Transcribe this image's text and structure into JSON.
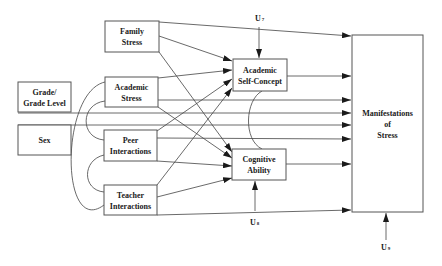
{
  "diagram": {
    "type": "path-model",
    "colors": {
      "line": "#444444",
      "box_border": "#555555",
      "text": "#1a1a1a",
      "background": "#ffffff"
    },
    "nodes": [
      {
        "id": "grade",
        "lines": [
          "Grade/",
          "Grade Level"
        ]
      },
      {
        "id": "sex",
        "lines": [
          "Sex"
        ]
      },
      {
        "id": "family",
        "lines": [
          "Family",
          "Stress"
        ]
      },
      {
        "id": "academic",
        "lines": [
          "Academic",
          "Stress"
        ]
      },
      {
        "id": "peer",
        "lines": [
          "Peer",
          "Interactions"
        ]
      },
      {
        "id": "teacher",
        "lines": [
          "Teacher",
          "Interactions"
        ]
      },
      {
        "id": "selfconcept",
        "lines": [
          "Academic",
          "Self-Concept"
        ]
      },
      {
        "id": "cognitive",
        "lines": [
          "Cognitive",
          "Ability"
        ]
      },
      {
        "id": "manifest",
        "lines": [
          "Manifestations",
          "of",
          "Stress"
        ]
      }
    ],
    "errors": [
      {
        "id": "u7",
        "label": "U",
        "sub": "7",
        "target": "selfconcept"
      },
      {
        "id": "u8",
        "label": "U",
        "sub": "8",
        "target": "cognitive"
      },
      {
        "id": "u9",
        "label": "U",
        "sub": "9",
        "target": "manifest"
      }
    ],
    "edges": [
      {
        "from": "family",
        "to": "manifest"
      },
      {
        "from": "family",
        "to": "selfconcept"
      },
      {
        "from": "family",
        "to": "cognitive"
      },
      {
        "from": "academic",
        "to": "selfconcept"
      },
      {
        "from": "academic",
        "to": "manifest"
      },
      {
        "from": "academic",
        "to": "cognitive"
      },
      {
        "from": "peer",
        "to": "selfconcept"
      },
      {
        "from": "peer",
        "to": "manifest"
      },
      {
        "from": "peer",
        "to": "cognitive"
      },
      {
        "from": "teacher",
        "to": "selfconcept"
      },
      {
        "from": "teacher",
        "to": "cognitive"
      },
      {
        "from": "teacher",
        "to": "manifest"
      },
      {
        "from": "grade",
        "to": "manifest"
      },
      {
        "from": "sex",
        "to": "manifest"
      },
      {
        "from": "selfconcept",
        "to": "manifest"
      },
      {
        "from": "cognitive",
        "to": "manifest"
      }
    ],
    "correlations": [
      {
        "a": "academic",
        "b": "peer"
      },
      {
        "a": "academic",
        "b": "teacher"
      },
      {
        "a": "peer",
        "b": "teacher"
      },
      {
        "a": "selfconcept",
        "b": "cognitive"
      }
    ]
  }
}
